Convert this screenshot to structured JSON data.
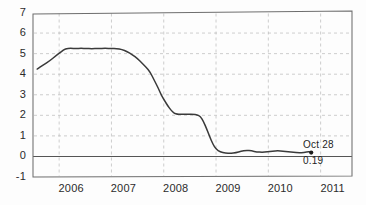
{
  "chart_data": {
    "type": "line",
    "title": "",
    "subtitle": "",
    "xlabel": "",
    "ylabel": "",
    "xlim": [
      2005.5,
      2011.6
    ],
    "ylim": [
      -1,
      7
    ],
    "grid": true,
    "grid_style": "dashed",
    "legend": "none",
    "y_ticks": [
      7,
      6,
      5,
      4,
      3,
      2,
      1,
      0,
      -1
    ],
    "y_tick_labels": [
      "7",
      "6",
      "5",
      "4",
      "3",
      "2",
      "1",
      "0",
      "-1"
    ],
    "x_ticks": [
      2006,
      2007,
      2008,
      2009,
      2010,
      2011
    ],
    "x_tick_labels": [
      "2006",
      "2007",
      "2008",
      "2009",
      "2010",
      "2011"
    ],
    "zero_line": 0,
    "series": [
      {
        "name": "rate",
        "color": "#3a3a3a",
        "x": [
          2005.58,
          2005.7,
          2005.82,
          2005.94,
          2006.04,
          2006.12,
          2006.22,
          2006.32,
          2006.42,
          2006.52,
          2006.62,
          2006.75,
          2006.88,
          2007.0,
          2007.1,
          2007.2,
          2007.3,
          2007.4,
          2007.5,
          2007.58,
          2007.66,
          2007.74,
          2007.82,
          2007.9,
          2007.96,
          2008.02,
          2008.08,
          2008.14,
          2008.2,
          2008.26,
          2008.32,
          2008.4,
          2008.48,
          2008.56,
          2008.64,
          2008.7,
          2008.76,
          2008.82,
          2008.88,
          2008.94,
          2009.0,
          2009.08,
          2009.18,
          2009.28,
          2009.38,
          2009.48,
          2009.58,
          2009.68,
          2009.78,
          2009.88,
          2009.98,
          2010.08,
          2010.18,
          2010.28,
          2010.38,
          2010.48,
          2010.58,
          2010.68,
          2010.78,
          2010.82
        ],
        "y": [
          4.25,
          4.45,
          4.65,
          4.9,
          5.1,
          5.25,
          5.26,
          5.25,
          5.26,
          5.25,
          5.24,
          5.25,
          5.26,
          5.25,
          5.25,
          5.2,
          5.1,
          4.95,
          4.75,
          4.55,
          4.35,
          4.1,
          3.7,
          3.3,
          2.95,
          2.7,
          2.45,
          2.25,
          2.1,
          2.05,
          2.05,
          2.06,
          2.05,
          2.05,
          2.02,
          1.95,
          1.7,
          1.35,
          0.95,
          0.6,
          0.35,
          0.22,
          0.16,
          0.15,
          0.18,
          0.25,
          0.3,
          0.27,
          0.22,
          0.2,
          0.22,
          0.26,
          0.28,
          0.26,
          0.22,
          0.2,
          0.18,
          0.19,
          0.24,
          0.19
        ]
      }
    ],
    "annotations": [
      {
        "name": "last-point",
        "date_label": "Oct 28",
        "value_label": "0.19",
        "x": 2010.82,
        "y": 0.19,
        "marker": "dot"
      }
    ]
  },
  "axis": {
    "y_labels": [
      "7",
      "6",
      "5",
      "4",
      "3",
      "2",
      "1",
      "0",
      "-1"
    ],
    "x_labels": [
      "2006",
      "2007",
      "2008",
      "2009",
      "2010",
      "2011"
    ]
  },
  "annotation": {
    "date": "Oct 28",
    "value": "0.19"
  },
  "colors": {
    "line": "#3a3a3a",
    "grid": "#b9b9b9",
    "frame": "#6e6e6e",
    "zero": "#555555",
    "text": "#2b2b2b"
  }
}
